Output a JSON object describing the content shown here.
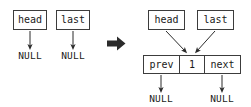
{
  "diagram": {
    "type": "linked-list-diagram",
    "colors": {
      "stroke": "#3c3c3c",
      "text": "#1a1a1a",
      "background": "#ffffff",
      "arrow": "#2b2b2b"
    },
    "before": {
      "pointers": [
        {
          "name": "head-pointer",
          "label": "head"
        },
        {
          "name": "last-pointer",
          "label": "last"
        }
      ],
      "targets": [
        {
          "name": "head-null",
          "label": "NULL"
        },
        {
          "name": "last-null",
          "label": "NULL"
        }
      ]
    },
    "transition": {
      "name": "transition-arrow",
      "glyph": "➡"
    },
    "after": {
      "pointers": [
        {
          "name": "head-pointer",
          "label": "head"
        },
        {
          "name": "last-pointer",
          "label": "last"
        }
      ],
      "node": {
        "name": "list-node",
        "cells": [
          {
            "name": "prev-field",
            "label": "prev"
          },
          {
            "name": "data-field",
            "label": "1"
          },
          {
            "name": "next-field",
            "label": "next"
          }
        ]
      },
      "targets": [
        {
          "name": "prev-null",
          "label": "NULL"
        },
        {
          "name": "next-null",
          "label": "NULL"
        }
      ]
    }
  }
}
